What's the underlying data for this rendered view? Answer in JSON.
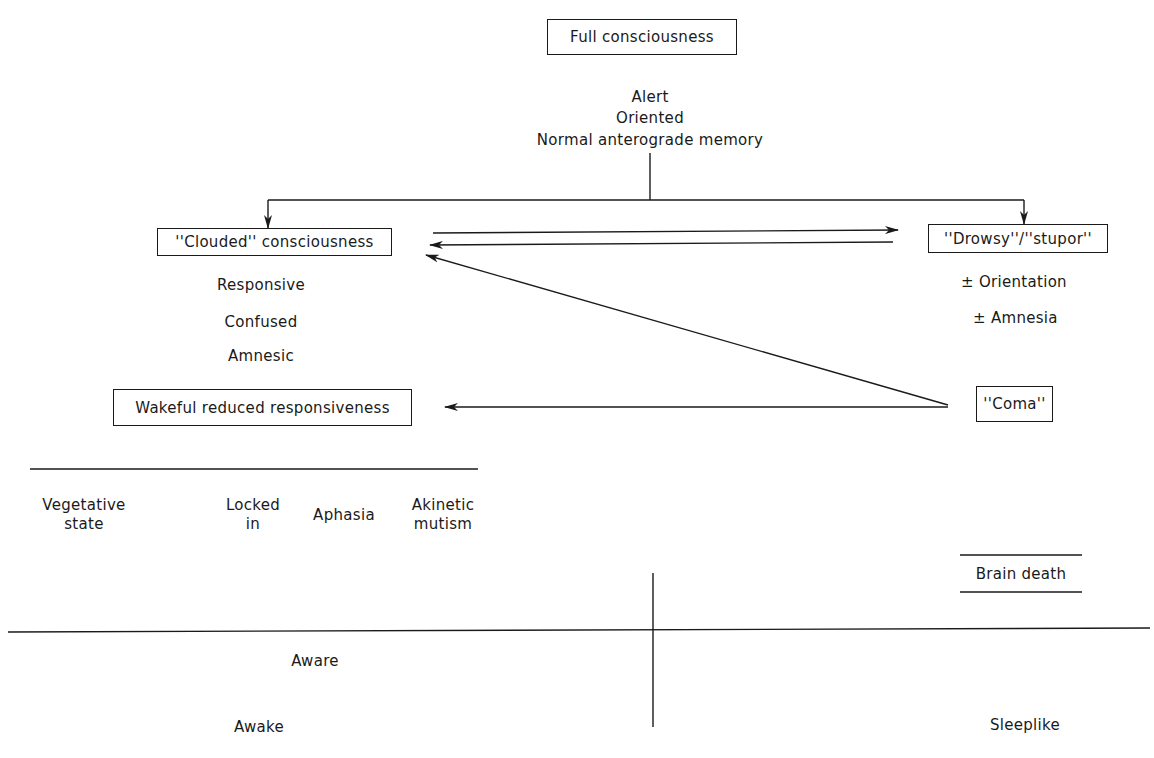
{
  "diagram": {
    "nodes": {
      "full_consciousness": {
        "label": "Full consciousness",
        "attributes": [
          "Alert",
          "Oriented",
          "Normal anterograde memory"
        ]
      },
      "clouded": {
        "label": "''Clouded'' consciousness",
        "attributes": [
          "Responsive",
          "Confused",
          "Amnesic"
        ]
      },
      "drowsy_stupor": {
        "label": "''Drowsy''/''stupor''",
        "attributes": [
          "± Orientation",
          "± Amnesia"
        ]
      },
      "wakeful": {
        "label": "Wakeful reduced responsiveness",
        "subtypes": [
          {
            "line1": "Vegetative",
            "line2": "state"
          },
          {
            "line1": "Locked",
            "line2": "in"
          },
          {
            "line1": "Aphasia",
            "line2": ""
          },
          {
            "line1": "Akinetic",
            "line2": "mutism"
          }
        ]
      },
      "coma": {
        "label": "''Coma''"
      },
      "brain_death": {
        "label": "Brain death"
      }
    },
    "edges": [
      {
        "from": "full_consciousness",
        "to": "clouded"
      },
      {
        "from": "full_consciousness",
        "to": "drowsy_stupor"
      },
      {
        "from": "clouded",
        "to": "drowsy_stupor"
      },
      {
        "from": "drowsy_stupor",
        "to": "clouded"
      },
      {
        "from": "coma",
        "to": "clouded"
      },
      {
        "from": "coma",
        "to": "wakeful"
      }
    ],
    "axis": {
      "top_left": "Aware",
      "bottom_left": "Awake",
      "bottom_right": "Sleeplike"
    },
    "colors": {
      "ink": "#1a1a1a",
      "background": "#ffffff"
    }
  }
}
